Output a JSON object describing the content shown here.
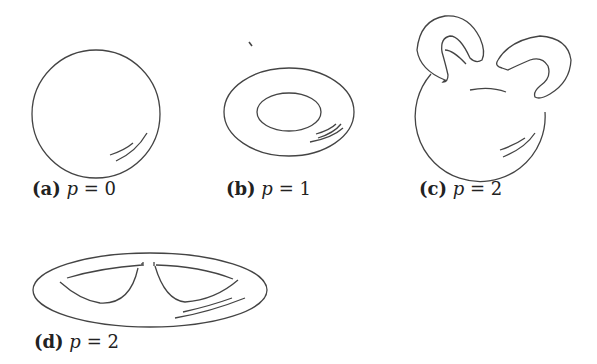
{
  "figure": {
    "panels": [
      {
        "id": "a",
        "tag": "(a)",
        "var": "p",
        "eq": "=",
        "value": "0",
        "shape": "sphere"
      },
      {
        "id": "b",
        "tag": "(b)",
        "var": "p",
        "eq": "=",
        "value": "1",
        "shape": "torus"
      },
      {
        "id": "c",
        "tag": "(c)",
        "var": "p",
        "eq": "=",
        "value": "2",
        "shape": "sphere-with-two-handles"
      },
      {
        "id": "d",
        "tag": "(d)",
        "var": "p",
        "eq": "=",
        "value": "2",
        "shape": "flattened-genus-two-surface"
      }
    ],
    "stroke_color": "#444444",
    "background": "#ffffff"
  }
}
